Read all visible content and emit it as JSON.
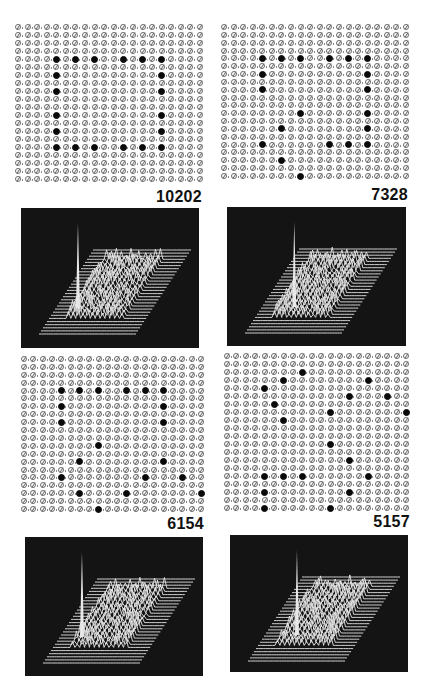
{
  "figure": {
    "grid_size": 20,
    "colors": {
      "background": "#ffffff",
      "dot": "#0a0a0a",
      "ring": "#6a6a6a",
      "panel": "#141414",
      "plot_line": "#e8e8e8"
    },
    "panels": [
      {
        "label": "10202",
        "grid": {
          "x": 15,
          "y": 24,
          "w": 188,
          "h": 158
        },
        "label_pos": {
          "right": 224,
          "top": 188
        },
        "plot": {
          "x": 21,
          "y": 208,
          "w": 178,
          "h": 140
        },
        "black_dots": [
          [
            4,
            4
          ],
          [
            4,
            6
          ],
          [
            4,
            8
          ],
          [
            4,
            11
          ],
          [
            4,
            13
          ],
          [
            4,
            15
          ],
          [
            6,
            4
          ],
          [
            6,
            15
          ],
          [
            8,
            4
          ],
          [
            8,
            15
          ],
          [
            11,
            4
          ],
          [
            11,
            15
          ],
          [
            13,
            4
          ],
          [
            13,
            15
          ],
          [
            15,
            4
          ],
          [
            15,
            6
          ],
          [
            15,
            8
          ],
          [
            15,
            11
          ],
          [
            15,
            13
          ],
          [
            15,
            15
          ]
        ]
      },
      {
        "label": "7328",
        "grid": {
          "x": 221,
          "y": 24,
          "w": 188,
          "h": 155
        },
        "label_pos": {
          "right": 18,
          "top": 186
        },
        "plot": {
          "x": 227,
          "y": 207,
          "w": 179,
          "h": 139
        },
        "black_dots": [
          [
            4,
            4
          ],
          [
            4,
            6
          ],
          [
            4,
            8
          ],
          [
            4,
            11
          ],
          [
            4,
            13
          ],
          [
            4,
            15
          ],
          [
            6,
            4
          ],
          [
            6,
            15
          ],
          [
            8,
            4
          ],
          [
            8,
            15
          ],
          [
            11,
            8
          ],
          [
            11,
            15
          ],
          [
            13,
            6
          ],
          [
            13,
            15
          ],
          [
            15,
            4
          ],
          [
            15,
            11
          ],
          [
            15,
            13
          ],
          [
            15,
            15
          ],
          [
            17,
            6
          ],
          [
            19,
            8
          ]
        ]
      },
      {
        "label": "6154",
        "grid": {
          "x": 21,
          "y": 356,
          "w": 183,
          "h": 156
        },
        "label_pos": {
          "right": 222,
          "top": 515
        },
        "plot": {
          "x": 25,
          "y": 537,
          "w": 178,
          "h": 139
        },
        "black_dots": [
          [
            4,
            4
          ],
          [
            4,
            6
          ],
          [
            4,
            8
          ],
          [
            4,
            11
          ],
          [
            4,
            13
          ],
          [
            4,
            15
          ],
          [
            6,
            4
          ],
          [
            6,
            15
          ],
          [
            8,
            4
          ],
          [
            8,
            15
          ],
          [
            11,
            8
          ],
          [
            13,
            6
          ],
          [
            13,
            15
          ],
          [
            15,
            4
          ],
          [
            15,
            13
          ],
          [
            15,
            17
          ],
          [
            17,
            6
          ],
          [
            17,
            11
          ],
          [
            17,
            19
          ],
          [
            19,
            8
          ]
        ]
      },
      {
        "label": "5157",
        "grid": {
          "x": 224,
          "y": 353,
          "w": 185,
          "h": 158
        },
        "label_pos": {
          "right": 16,
          "top": 513
        },
        "plot": {
          "x": 230,
          "y": 535,
          "w": 178,
          "h": 137
        },
        "black_dots": [
          [
            2,
            8
          ],
          [
            3,
            6
          ],
          [
            3,
            15
          ],
          [
            4,
            4
          ],
          [
            5,
            13
          ],
          [
            5,
            17
          ],
          [
            6,
            5
          ],
          [
            7,
            11
          ],
          [
            7,
            19
          ],
          [
            8,
            6
          ],
          [
            11,
            11
          ],
          [
            13,
            13
          ],
          [
            15,
            4
          ],
          [
            15,
            6
          ],
          [
            15,
            8
          ],
          [
            15,
            15
          ],
          [
            17,
            4
          ],
          [
            17,
            13
          ],
          [
            19,
            4
          ],
          [
            19,
            11
          ]
        ]
      }
    ]
  }
}
